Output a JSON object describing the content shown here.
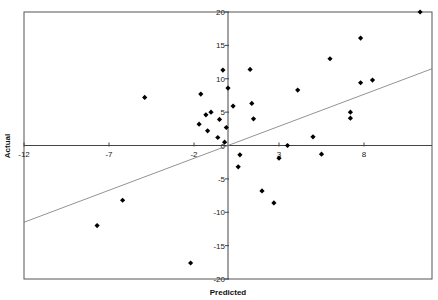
{
  "chart_data": {
    "type": "scatter",
    "title": "",
    "xlabel": "Predicted",
    "ylabel": "Actual",
    "xlim": [
      -12,
      12
    ],
    "ylim": [
      -20,
      20
    ],
    "x_ticks": [
      -12,
      -7,
      -2,
      3,
      8
    ],
    "y_ticks": [
      -20,
      -15,
      -10,
      -5,
      0,
      5,
      10,
      15,
      20
    ],
    "x_tick_labels": [
      "-12",
      "-7",
      "-2",
      "3",
      "8"
    ],
    "y_tick_labels": [
      "-20",
      "-15",
      "-10",
      "-5",
      "0",
      "5",
      "10",
      "15",
      "20"
    ],
    "grid": false,
    "legend": null,
    "axes_cross_at_origin": true,
    "marker": "diamond",
    "marker_color": "#000000",
    "trendline": {
      "type": "linear",
      "color": "#777777",
      "start": [
        -12,
        -11.5
      ],
      "end": [
        12,
        11.5
      ]
    },
    "series": [
      {
        "name": "Actual vs Predicted",
        "points": [
          [
            -7.7,
            -12.0
          ],
          [
            -6.2,
            -8.2
          ],
          [
            -4.9,
            7.2
          ],
          [
            -2.2,
            -17.6
          ],
          [
            -1.7,
            3.2
          ],
          [
            -1.6,
            7.7
          ],
          [
            -1.3,
            4.6
          ],
          [
            -1.2,
            2.2
          ],
          [
            -1.0,
            5.0
          ],
          [
            -0.6,
            1.2
          ],
          [
            -0.5,
            3.9
          ],
          [
            -0.3,
            11.3
          ],
          [
            -0.2,
            0.5
          ],
          [
            -0.1,
            2.7
          ],
          [
            0.0,
            8.6
          ],
          [
            0.3,
            5.9
          ],
          [
            0.7,
            -1.4
          ],
          [
            0.6,
            -3.2
          ],
          [
            1.3,
            11.4
          ],
          [
            1.4,
            6.3
          ],
          [
            1.5,
            4.0
          ],
          [
            2.0,
            -6.8
          ],
          [
            2.7,
            -8.6
          ],
          [
            3.0,
            -1.9
          ],
          [
            3.5,
            0.0
          ],
          [
            4.1,
            8.3
          ],
          [
            5.0,
            1.3
          ],
          [
            5.5,
            -1.3
          ],
          [
            6.0,
            13.0
          ],
          [
            7.2,
            4.1
          ],
          [
            7.2,
            5.0
          ],
          [
            7.8,
            9.4
          ],
          [
            7.8,
            16.1
          ],
          [
            8.5,
            9.8
          ],
          [
            11.3,
            20.0
          ]
        ]
      }
    ]
  }
}
